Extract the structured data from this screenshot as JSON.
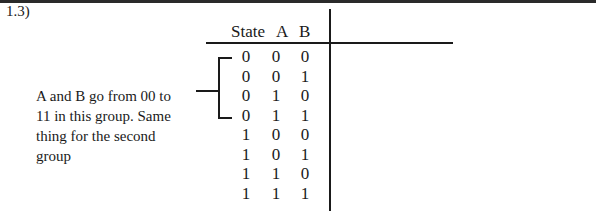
{
  "problem_label": "1.3)",
  "table": {
    "headers": [
      "State",
      "A",
      "B"
    ],
    "rows": [
      [
        "0",
        "0",
        "0"
      ],
      [
        "0",
        "0",
        "1"
      ],
      [
        "0",
        "1",
        "0"
      ],
      [
        "0",
        "1",
        "1"
      ],
      [
        "1",
        "0",
        "0"
      ],
      [
        "1",
        "0",
        "1"
      ],
      [
        "1",
        "1",
        "0"
      ],
      [
        "1",
        "1",
        "1"
      ]
    ]
  },
  "annotation": {
    "lines": [
      "A and B go from 00 to",
      "11 in this group. Same",
      "thing for the second",
      "group"
    ]
  }
}
